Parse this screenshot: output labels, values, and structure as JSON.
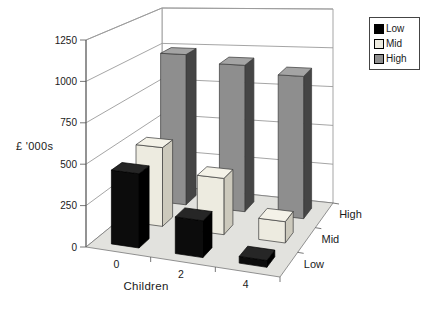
{
  "chart_data": {
    "type": "bar",
    "projection": "3d-perspective",
    "title": "",
    "value_axis": {
      "label": "£ '000s",
      "ticks": [
        0,
        250,
        500,
        750,
        1000,
        1250
      ],
      "max": 1250
    },
    "category_axis": {
      "label": "Children",
      "categories": [
        "0",
        "2",
        "4"
      ]
    },
    "series_axis": {
      "categories": [
        "Low",
        "Mid",
        "High"
      ]
    },
    "series": [
      {
        "name": "Low",
        "values": [
          450,
          220,
          40
        ],
        "front": "#0c0c0c",
        "side": "#000000",
        "top": "#262626",
        "stroke": "#000000"
      },
      {
        "name": "Mid",
        "values": [
          500,
          350,
          130
        ],
        "front": "#edebe0",
        "side": "#ccc9bc",
        "top": "#f4f2e8",
        "stroke": "#3a3a3a"
      },
      {
        "name": "High",
        "values": [
          1000,
          950,
          900
        ],
        "front": "#8e8e8e",
        "side": "#454545",
        "top": "#a4a4a4",
        "stroke": "#3a3a3a"
      }
    ],
    "legend": {
      "position": "top-right",
      "items": [
        {
          "label": "Low",
          "swatch": "#000000"
        },
        {
          "label": "Mid",
          "swatch": "#edebe0"
        },
        {
          "label": "High",
          "swatch": "#8e8e8e"
        }
      ]
    },
    "grid": "on",
    "colors": {
      "floor": "#e2e2de",
      "wall": "#ffffff",
      "gridline": "#9b9b9b",
      "axis": "#555555",
      "text": "#1a1a1a"
    }
  }
}
